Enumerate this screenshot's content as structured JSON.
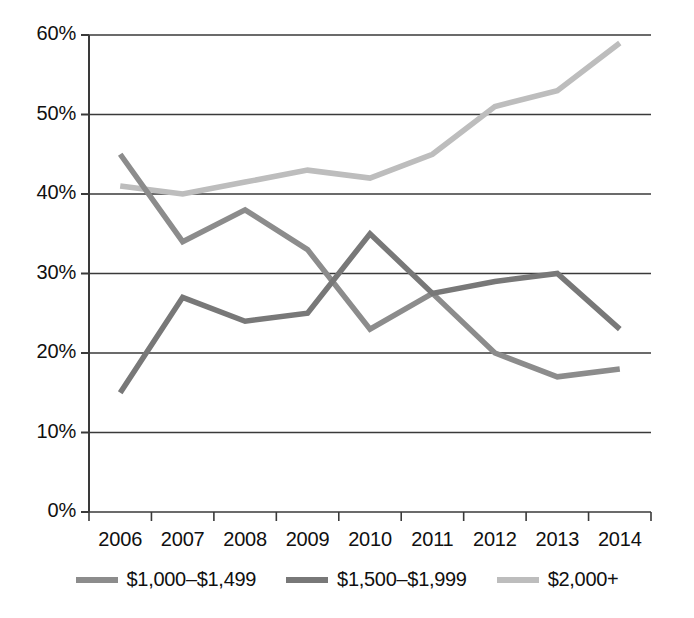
{
  "chart_data": {
    "type": "line",
    "title": "",
    "subtitle": "",
    "xlabel": "",
    "ylabel": "",
    "categories": [
      "2006",
      "2007",
      "2008",
      "2009",
      "2010",
      "2011",
      "2012",
      "2013",
      "2014"
    ],
    "ylim": [
      0,
      60
    ],
    "ytick_labels": [
      "0%",
      "10%",
      "20%",
      "30%",
      "40%",
      "50%",
      "60%"
    ],
    "ytick_values": [
      0,
      10,
      20,
      30,
      40,
      50,
      60
    ],
    "grid": "horizontal",
    "legend_position": "bottom",
    "series": [
      {
        "name": "$1,000–$1,499",
        "color": "#8c8c8c",
        "values": [
          45,
          34,
          38,
          33,
          23,
          27.5,
          20,
          17,
          18
        ]
      },
      {
        "name": "$1,500–$1,999",
        "color": "#787878",
        "values": [
          15,
          27,
          24,
          25,
          35,
          27.5,
          29,
          30,
          23
        ]
      },
      {
        "name": "$2,000+",
        "color": "#bdbdbd",
        "values": [
          41,
          40,
          41.5,
          43,
          42,
          45,
          51,
          53,
          59
        ]
      }
    ]
  },
  "axis": {
    "axis_color": "#3a3a3a",
    "grid_color": "#3a3a3a"
  }
}
